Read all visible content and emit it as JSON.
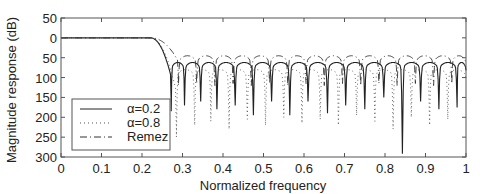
{
  "chart_data": {
    "type": "line",
    "title": "",
    "xlabel": "Normalized frequency",
    "ylabel": "Magnitude response (dB)",
    "xlim": [
      0,
      1
    ],
    "ylim": [
      -50,
      300
    ],
    "y_inverted": true,
    "grid": false,
    "legend_position": "bottom-left",
    "x_ticks": [
      0,
      0.1,
      0.2,
      0.3,
      0.4,
      0.5,
      0.6,
      0.7,
      0.8,
      0.9,
      1
    ],
    "x_tick_labels": [
      "0",
      "0.1",
      "0.2",
      "0.3",
      "0.4",
      "0.5",
      "0.6",
      "0.7",
      "0.8",
      "0.9",
      "1"
    ],
    "y_ticks": [
      -50,
      0,
      50,
      100,
      150,
      200,
      250,
      300
    ],
    "y_tick_labels": [
      "50",
      "0",
      "50",
      "100",
      "150",
      "200",
      "250",
      "300"
    ],
    "passband_edge": 0.22,
    "stopband_start": 0.265,
    "series": [
      {
        "name": "α=0.2",
        "style": "solid",
        "color": "#222222",
        "sidelobe_peaks_db": 62,
        "nulls": [
          0.272,
          0.305,
          0.345,
          0.385,
          0.43,
          0.475,
          0.52,
          0.565,
          0.61,
          0.658,
          0.703,
          0.75,
          0.797,
          0.843,
          0.888,
          0.933,
          0.978
        ],
        "null_depths_db": [
          165,
          150,
          140,
          160,
          150,
          175,
          140,
          175,
          140,
          170,
          150,
          160,
          130,
          272,
          140,
          160,
          155
        ]
      },
      {
        "name": "α=0.8",
        "style": "dotted",
        "color": "#555555",
        "sidelobe_peaks_db": 80,
        "nulls": [
          0.285,
          0.33,
          0.37,
          0.415,
          0.46,
          0.505,
          0.55,
          0.595,
          0.64,
          0.685,
          0.73,
          0.775,
          0.82,
          0.865,
          0.91,
          0.955
        ],
        "null_depths_db": [
          230,
          200,
          190,
          210,
          185,
          200,
          180,
          195,
          185,
          200,
          175,
          190,
          210,
          180,
          200,
          185
        ]
      },
      {
        "name": "Remez",
        "style": "dashdot",
        "color": "#333333",
        "sidelobe_peaks_db": 45,
        "nulls": [
          0.29,
          0.335,
          0.38,
          0.425,
          0.47,
          0.515,
          0.56,
          0.605,
          0.65,
          0.695,
          0.74,
          0.785,
          0.83,
          0.875,
          0.92,
          0.965
        ],
        "null_depths_db": [
          100,
          95,
          100,
          95,
          100,
          95,
          100,
          95,
          100,
          95,
          100,
          95,
          100,
          95,
          100,
          95
        ]
      }
    ]
  }
}
